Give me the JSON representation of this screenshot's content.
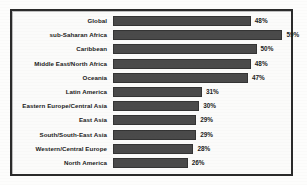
{
  "chart_data": {
    "type": "bar",
    "orientation": "horizontal",
    "title": "",
    "subtitle": "",
    "xlabel": "",
    "ylabel": "",
    "grid": false,
    "legend": "none",
    "xlim": [
      0,
      62
    ],
    "value_suffix": "%",
    "categories": [
      "Global",
      "sub-Saharan Africa",
      "Caribbean",
      "Middle East/North Africa",
      "Oceania",
      "Latin America",
      "Eastern Europe/Central Asia",
      "East Asia",
      "South/South-East Asia",
      "Western/Central Europe",
      "North America"
    ],
    "values": [
      48,
      59,
      50,
      48,
      47,
      31,
      30,
      29,
      29,
      28,
      26
    ],
    "value_labels": [
      "48%",
      "59%",
      "50%",
      "48%",
      "47%",
      "31%",
      "30%",
      "29%",
      "29%",
      "28%",
      "26%"
    ],
    "bar_color": "#4a4a4a",
    "background_color": "#fbfbfa",
    "frame_color": "#2b2b2b"
  }
}
